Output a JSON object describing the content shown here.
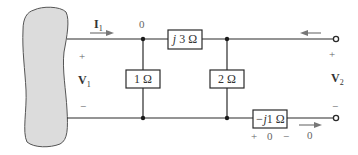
{
  "diagram": {
    "type": "two-port circuit",
    "network_label": "",
    "components": [
      {
        "id": "series_top",
        "label": "j3 Ω",
        "italic_prefix": "j",
        "value": "3 Ω"
      },
      {
        "id": "shunt_1",
        "label": "1 Ω"
      },
      {
        "id": "shunt_2",
        "label": "2 Ω"
      },
      {
        "id": "series_bottom",
        "label": "−j1 Ω",
        "italic_prefix": "−j",
        "value": "1 Ω"
      }
    ],
    "port1": {
      "current": "I",
      "current_sub": "1",
      "voltage": "V",
      "voltage_sub": "1",
      "plus": "+",
      "minus": "−"
    },
    "port2": {
      "voltage": "V",
      "voltage_sub": "2",
      "plus": "+",
      "minus": "−",
      "top_current": "0",
      "bottom_current": "0"
    },
    "bottom_resistor_voltage": {
      "plus": "+",
      "value": "0",
      "minus": "−"
    },
    "colors": {
      "wire": "#2a2a2a",
      "blob_fill": "#dcdcdc",
      "blob_stroke": "#555555",
      "arrow": "#777777"
    }
  }
}
